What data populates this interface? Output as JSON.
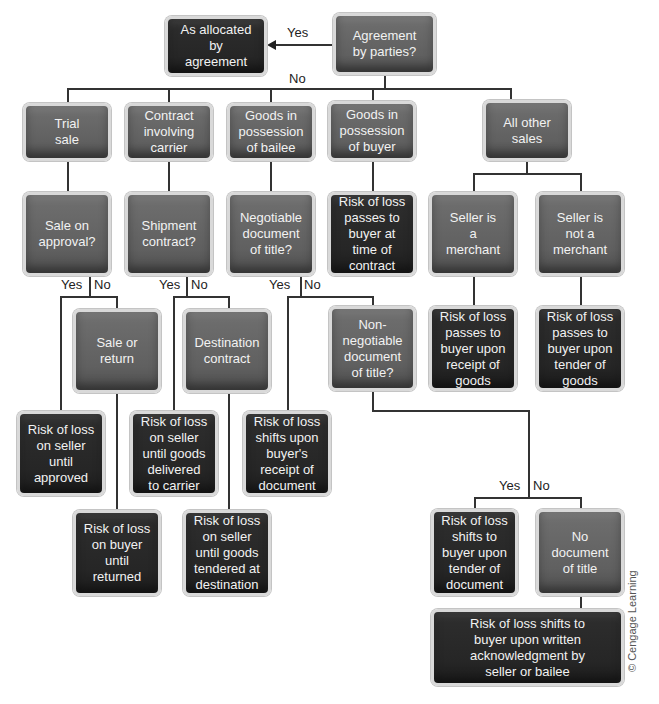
{
  "diagram": {
    "type": "decision-flowchart",
    "colors": {
      "question_box": "#636363",
      "result_box": "#262626",
      "box_border": "#d9d9d9",
      "line": "#333333",
      "text": "#f2f2f2"
    },
    "nodes": {
      "as_allocated": "As allocated\nby\nagreement",
      "agreement_by_parties": "Agreement\nby parties?",
      "trial_sale": "Trial\nsale",
      "contract_carrier": "Contract\ninvolving\ncarrier",
      "goods_bailee": "Goods in\npossession\nof bailee",
      "goods_buyer": "Goods in\npossession\nof buyer",
      "all_other_sales": "All other\nsales",
      "sale_on_approval": "Sale on\napproval?",
      "shipment_contract": "Shipment\ncontract?",
      "negotiable_doc": "Negotiable\ndocument\nof title?",
      "risk_time_of_contract": "Risk of loss\npasses to\nbuyer at\ntime of\ncontract",
      "seller_merchant": "Seller is\na\nmerchant",
      "seller_not_merchant": "Seller is\nnot a\nmerchant",
      "sale_or_return": "Sale or\nreturn",
      "destination_contract": "Destination\ncontract",
      "non_negotiable_doc": "Non-\nnegotiable\ndocument\nof title?",
      "risk_receipt_goods": "Risk of loss\npasses to\nbuyer upon\nreceipt of\ngoods",
      "risk_tender_goods": "Risk of loss\npasses to\nbuyer upon\ntender of\ngoods",
      "risk_seller_approved": "Risk of loss\non seller\nuntil\napproved",
      "risk_seller_carrier": "Risk of loss\non seller\nuntil goods\ndelivered\nto carrier",
      "risk_receipt_document": "Risk of loss\nshifts upon\nbuyer's\nreceipt of\ndocument",
      "risk_buyer_returned": "Risk of loss\non buyer\nuntil\nreturned",
      "risk_seller_destination": "Risk of loss\non seller\nuntil goods\ntendered at\ndestination",
      "risk_tender_document": "Risk of loss\nshifts to\nbuyer upon\ntender of\ndocument",
      "no_document": "No\ndocument\nof title",
      "risk_written_ack": "Risk of loss shifts to\nbuyer upon written\nacknowledgment by\nseller or bailee"
    },
    "labels": {
      "yes": "Yes",
      "no": "No"
    },
    "credit": "© Cengage Learning"
  }
}
